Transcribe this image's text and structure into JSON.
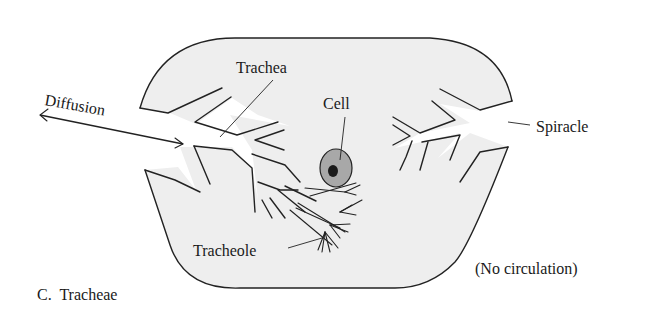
{
  "figure": {
    "panel_label": "C.  Tracheae",
    "annotation": "(No circulation)"
  },
  "labels": {
    "diffusion": "Diffusion",
    "trachea": "Trachea",
    "cell": "Cell",
    "spiracle": "Spiracle",
    "tracheole": "Tracheole"
  },
  "colors": {
    "body_fill": "#eeeeee",
    "cell_fill": "#a8a8a8",
    "nucleus_fill": "#1a1a1a",
    "line": "#222222",
    "background": "#ffffff"
  }
}
